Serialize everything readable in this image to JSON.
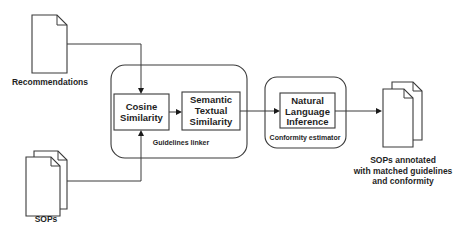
{
  "diagram": {
    "inputs": {
      "recommendations": {
        "label": "Recommendations",
        "icon": "document-icon"
      },
      "sops": {
        "label": "SOPs",
        "icon": "documents-stack-icon"
      }
    },
    "groups": {
      "guidelines_linker": {
        "label": "Guidelines linker",
        "nodes": {
          "cosine": {
            "line1": "Cosine",
            "line2": "Similarity"
          },
          "semantic": {
            "line1": "Semantic",
            "line2": "Textual",
            "line3": "Similarity"
          }
        }
      },
      "conformity_estimator": {
        "label": "Conformity estimator",
        "nodes": {
          "nli": {
            "line1": "Natural",
            "line2": "Language",
            "line3": "Inference"
          }
        }
      }
    },
    "output": {
      "icon": "documents-stack-icon",
      "line1": "SOPs annotated",
      "line2": "with matched guidelines",
      "line3": "and conformity"
    },
    "edges": [
      {
        "from": "Recommendations",
        "to": "Cosine Similarity"
      },
      {
        "from": "SOPs",
        "to": "Cosine Similarity"
      },
      {
        "from": "Cosine Similarity",
        "to": "Semantic Textual Similarity"
      },
      {
        "from": "Semantic Textual Similarity",
        "to": "Natural Language Inference"
      },
      {
        "from": "Natural Language Inference",
        "to": "SOPs annotated with matched guidelines and conformity"
      }
    ]
  }
}
